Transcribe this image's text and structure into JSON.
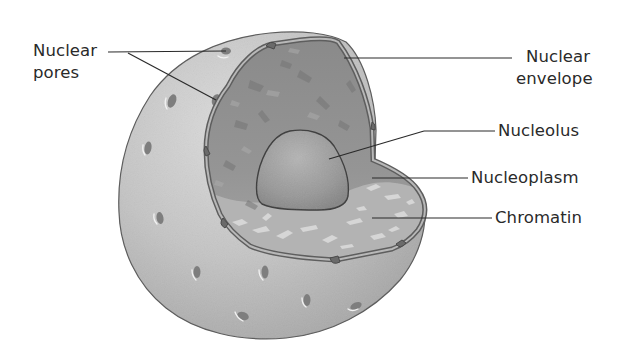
{
  "diagram": {
    "colors": {
      "background": "#ffffff",
      "outer_surface": "#bdbdbd",
      "outer_surface_light": "#d6d6d6",
      "interior": "#8e8e8e",
      "nucleoplasm_light": "#cfcfcf",
      "nucleolus": "#9a9a9a",
      "envelope": "#6a6a6a",
      "leader_line": "#2a2a2a",
      "label_text": "#2a2a2a"
    },
    "labels": [
      {
        "id": "nuclear-pores",
        "lines": [
          "Nuclear",
          "pores"
        ],
        "side": "left"
      },
      {
        "id": "nuclear-envelope",
        "lines": [
          "Nuclear",
          "envelope"
        ],
        "side": "right"
      },
      {
        "id": "nucleolus",
        "lines": [
          "Nucleolus"
        ],
        "side": "right"
      },
      {
        "id": "nucleoplasm",
        "lines": [
          "Nucleoplasm"
        ],
        "side": "right"
      },
      {
        "id": "chromatin",
        "lines": [
          "Chromatin"
        ],
        "side": "right"
      }
    ]
  }
}
